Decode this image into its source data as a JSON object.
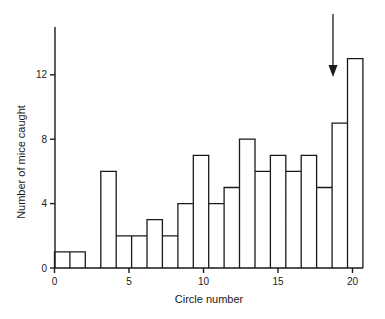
{
  "chart_data": {
    "type": "bar",
    "style": "step-histogram",
    "title": "",
    "xlabel": "Circle number",
    "ylabel": "Number of mice caught",
    "categories": [
      1,
      2,
      3,
      4,
      5,
      6,
      7,
      8,
      9,
      10,
      11,
      12,
      13,
      14,
      15,
      16,
      17,
      18,
      19,
      20
    ],
    "values": [
      1,
      1,
      0,
      6,
      2,
      2,
      3,
      2,
      4,
      7,
      4,
      5,
      8,
      6,
      7,
      6,
      7,
      5,
      9,
      13
    ],
    "xlim": [
      0,
      20.7
    ],
    "ylim": [
      0,
      14.8
    ],
    "xticks": [
      0,
      5,
      10,
      15,
      20
    ],
    "yticks": [
      0,
      4,
      8,
      12
    ],
    "grid": false,
    "legend": null,
    "annotations": [
      {
        "type": "arrow",
        "direction": "down",
        "x": 18.6,
        "description": "downward arrow pointing at circle 19"
      }
    ]
  }
}
